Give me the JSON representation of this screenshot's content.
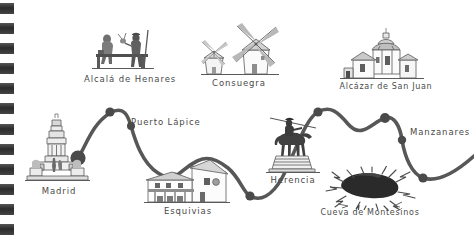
{
  "page": {
    "medium": "spiral-bound sketchbook page",
    "background_color": "#ffffff",
    "ink_color": "#4a4a4a",
    "binding": {
      "mark_count": 12,
      "color": "#3a3a3a"
    }
  },
  "chart_data": {
    "type": "line",
    "xlabel": "",
    "ylabel": "",
    "grid": false,
    "legend": "none",
    "annotations": [
      "Hand-drawn illustrated travel route through La Mancha, Spain",
      "Each node marks a stop on the Don Quixote route"
    ],
    "categories": [
      "Madrid",
      "Puerto Lápice",
      "Esquivias",
      "Herencia",
      "Manzanares"
    ],
    "x": [
      78,
      131,
      172,
      250,
      402
    ],
    "values": [
      158,
      125,
      178,
      196,
      140
    ],
    "series": [
      {
        "name": "Ruta del Quijote",
        "values": [
          158,
          125,
          178,
          196,
          140
        ]
      }
    ]
  },
  "route": {
    "name": "Ruta del Quijote",
    "line_color": "#4a4a4a",
    "nodes": [
      {
        "id": "madrid",
        "x": 78,
        "y": 158,
        "r": 7.5,
        "kind": "origin-node"
      },
      {
        "id": "puerto-lapice",
        "x": 131,
        "y": 125,
        "r": 4.0,
        "kind": "waypoint-node"
      },
      {
        "id": "esquivias",
        "x": 172,
        "y": 178,
        "r": 4.5,
        "kind": "waypoint-node"
      },
      {
        "id": "herencia",
        "x": 250,
        "y": 196,
        "r": 4.5,
        "kind": "waypoint-node"
      },
      {
        "id": "peak-1",
        "x": 110,
        "y": 112,
        "r": 4.5,
        "kind": "waypoint-node"
      },
      {
        "id": "peak-2",
        "x": 318,
        "y": 112,
        "r": 4.5,
        "kind": "waypoint-node"
      },
      {
        "id": "peak-3",
        "x": 385,
        "y": 118,
        "r": 5.0,
        "kind": "waypoint-node"
      },
      {
        "id": "manzanares",
        "x": 402,
        "y": 140,
        "r": 4.0,
        "kind": "waypoint-node"
      },
      {
        "id": "valley-right",
        "x": 423,
        "y": 178,
        "r": 4.5,
        "kind": "waypoint-node"
      }
    ]
  },
  "landmarks": [
    {
      "id": "madrid",
      "label": "Madrid",
      "icon": "cervantes-monument-icon",
      "description": "Monument to Cervantes, Plaza de España"
    },
    {
      "id": "alcala-de-henares",
      "label": "Alcalá de Henares",
      "icon": "quixote-sancho-bench-statue-icon",
      "description": "Bronze statues of Don Quixote and Sancho Panza on a bench"
    },
    {
      "id": "consuegra",
      "label": "Consuegra",
      "icon": "windmills-icon",
      "description": "Windmills of Consuegra"
    },
    {
      "id": "alcazar-de-san-juan",
      "label": "Alcázar de San Juan",
      "icon": "church-icon",
      "description": "Church of Santa María la Mayor"
    },
    {
      "id": "puerto-lapice",
      "label": "Puerto Lápice",
      "icon": "route-waypoint-icon",
      "description": "Route waypoint label"
    },
    {
      "id": "esquivias",
      "label": "Esquivias",
      "icon": "casa-museo-cervantes-icon",
      "description": "Casa Museo de Cervantes, whitewashed manor house"
    },
    {
      "id": "herencia",
      "label": "Herencia",
      "icon": "quixote-equestrian-statue-icon",
      "description": "Equestrian statue of Don Quixote on a pedestal"
    },
    {
      "id": "cueva-de-montesinos",
      "label": "Cueva de Montesinos",
      "icon": "cave-mouth-icon",
      "description": "Dark cave entrance in rock"
    },
    {
      "id": "manzanares",
      "label": "Manzanares",
      "icon": "route-waypoint-icon",
      "description": "Route waypoint label"
    }
  ]
}
